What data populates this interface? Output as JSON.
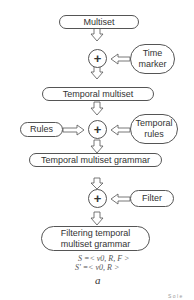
{
  "diagram": {
    "nodes": {
      "multiset": "Multiset",
      "time_marker_line1": "Time",
      "time_marker_line2": "marker",
      "temporal_multiset": "Temporal multiset",
      "rules": "Rules",
      "temporal_rules_line1": "Temporal",
      "temporal_rules_line2": "rules",
      "temporal_multiset_grammar": "Temporal multiset grammar",
      "filter": "Filter",
      "filtering_line1": "Filtering temporal",
      "filtering_line2": "multiset grammar"
    },
    "operators": [
      "+",
      "+",
      "+"
    ],
    "formulas": [
      "S =< v0, R, F >",
      "S' =< v0, R >"
    ],
    "caption": "a",
    "corner_text": "S o l e"
  }
}
